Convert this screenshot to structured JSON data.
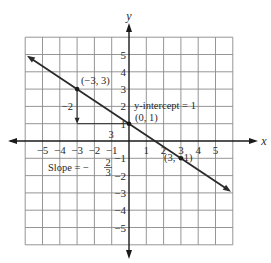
{
  "chart_data": {
    "type": "line",
    "title": "",
    "xlabel": "x",
    "ylabel": "y",
    "xlim": [
      -6,
      6
    ],
    "ylim": [
      -6,
      6
    ],
    "grid": true,
    "x_ticks": [
      -5,
      -4,
      -3,
      -2,
      -1,
      1,
      2,
      3,
      4,
      5
    ],
    "x_tick_labels": [
      "−5",
      "−4",
      "−3",
      "−2",
      "−1",
      "1",
      "2",
      "3",
      "4",
      "5"
    ],
    "y_ticks": [
      5,
      4,
      3,
      2,
      1,
      -1,
      -2,
      -3,
      -4,
      -5
    ],
    "y_tick_labels": [
      "5",
      "4",
      "3",
      "2",
      "1",
      "−1",
      "−2",
      "−3",
      "−4",
      "−5"
    ],
    "series": [
      {
        "name": "line",
        "equation": "y = -2/3 x + 1",
        "slope": -0.6667,
        "intercept": 1,
        "x_range": [
          -6,
          6
        ]
      }
    ],
    "points": [
      {
        "x": -3,
        "y": 3,
        "label": "(−3, 3)"
      },
      {
        "x": 0,
        "y": 1,
        "label": "(0, 1)"
      },
      {
        "x": 3,
        "y": -1,
        "label": "(3, −1)"
      }
    ],
    "slope_triangle": {
      "rise": {
        "from": [
          -3,
          3
        ],
        "to": [
          -3,
          1
        ],
        "label": "−2"
      },
      "run": {
        "from": [
          -3,
          1
        ],
        "to": [
          0,
          1
        ],
        "label": "3"
      }
    },
    "annotations": {
      "y_intercept": "y-intercept = 1",
      "slope_text": "Slope = −",
      "slope_num": "2",
      "slope_den": "3"
    }
  }
}
